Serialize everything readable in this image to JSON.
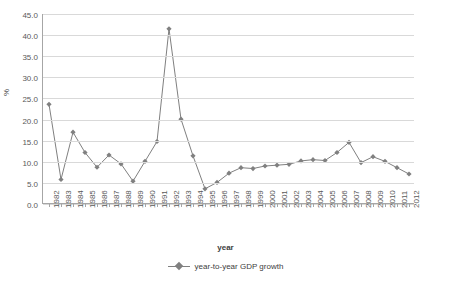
{
  "chart_data": {
    "type": "line",
    "title": "",
    "xlabel": "year",
    "ylabel": "%",
    "ylim": [
      0,
      45
    ],
    "yticks": [
      0,
      5,
      10,
      15,
      20,
      25,
      30,
      35,
      40,
      45
    ],
    "ytick_labels": [
      "0.0",
      "5.0",
      "10.0",
      "15.0",
      "20.0",
      "25.0",
      "30.0",
      "35.0",
      "40.0",
      "45.0"
    ],
    "grid": true,
    "legend_position": "bottom",
    "series": [
      {
        "name": "year-to-year GDP growth",
        "color": "#808080",
        "marker": "diamond",
        "values": [
          23.6,
          5.8,
          17.0,
          12.2,
          8.7,
          11.6,
          9.5,
          5.4,
          10.1,
          14.8,
          41.5,
          20.1,
          11.4,
          3.6,
          5.1,
          7.3,
          8.6,
          8.4,
          9.0,
          9.2,
          9.4,
          10.2,
          10.5,
          10.3,
          12.2,
          14.6,
          9.8,
          11.2,
          10.1,
          8.6,
          7.1
        ]
      }
    ],
    "categories": [
      "1982",
      "1983",
      "1984",
      "1985",
      "1986",
      "1987",
      "1988",
      "1989",
      "1990",
      "1991",
      "1992",
      "1993",
      "1994",
      "1995",
      "1996",
      "1997",
      "1998",
      "1999",
      "2000",
      "2001",
      "2002",
      "2003",
      "2004",
      "2005",
      "2006",
      "2007",
      "2008",
      "2009",
      "2010",
      "2011",
      "2012"
    ]
  },
  "legend": {
    "entries": [
      "year-to-year GDP growth"
    ]
  }
}
